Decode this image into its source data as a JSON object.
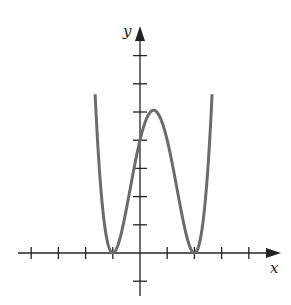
{
  "chart_data": {
    "type": "line",
    "title": "",
    "xlabel": "x",
    "ylabel": "y",
    "function": "y = (x+1)^2 (x-2)^2",
    "xlim": [
      -4.1,
      5.3
    ],
    "ylim": [
      -1.7,
      8.2
    ],
    "x_ticks": [
      -4,
      -3,
      -2,
      -1,
      1,
      2,
      3,
      4
    ],
    "y_ticks": [
      -1,
      1,
      2,
      3,
      4,
      5,
      6,
      7
    ],
    "tick_labels_shown": false,
    "grid": false,
    "series": [
      {
        "name": "curve",
        "color": "#6b6b6b",
        "points": [
          [
            -1.65,
            8.1
          ],
          [
            -1.5,
            7.56
          ],
          [
            -1.25,
            5.2
          ],
          [
            -1.0,
            0.0
          ],
          [
            -0.75,
            0.29
          ],
          [
            -0.5,
            1.27
          ],
          [
            -0.25,
            2.57
          ],
          [
            0.0,
            4.0
          ],
          [
            0.25,
            4.84
          ],
          [
            0.5,
            5.06
          ],
          [
            0.75,
            4.84
          ],
          [
            1.0,
            4.0
          ],
          [
            1.25,
            2.57
          ],
          [
            1.5,
            1.27
          ],
          [
            1.75,
            0.29
          ],
          [
            2.0,
            0.0
          ],
          [
            2.25,
            0.8
          ],
          [
            2.5,
            3.06
          ],
          [
            2.65,
            8.1
          ]
        ],
        "roots": [
          -1,
          2
        ],
        "local_max": [
          0.5,
          5.0625
        ],
        "y_intercept": 4
      }
    ],
    "axis_color": "#222222"
  }
}
